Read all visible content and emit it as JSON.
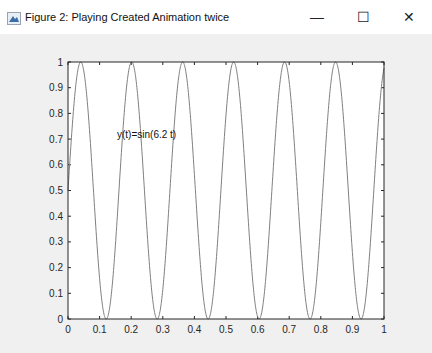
{
  "window": {
    "title": "Figure 2: Playing Created Animation twice",
    "icon": "matlab-figure-icon",
    "controls": {
      "minimize": "—",
      "maximize": "☐",
      "close": "✕"
    }
  },
  "annotation": "y(t)=sin(6.2 t)",
  "chart_data": {
    "type": "line",
    "title": "",
    "xlabel": "",
    "ylabel": "",
    "xlim": [
      0,
      1
    ],
    "ylim": [
      0,
      1
    ],
    "xticks": [
      "0",
      "0.1",
      "0.2",
      "0.3",
      "0.4",
      "0.5",
      "0.6",
      "0.7",
      "0.8",
      "0.9",
      "1"
    ],
    "yticks": [
      "0",
      "0.1",
      "0.2",
      "0.3",
      "0.4",
      "0.5",
      "0.6",
      "0.7",
      "0.8",
      "0.9",
      "1"
    ],
    "annotation": "y(t)=sin(6.2 t)",
    "series": [
      {
        "name": "y(t)",
        "formula": "0.5+0.5*sin(2*pi*6.2*t)",
        "color": "#808080"
      }
    ],
    "grid": false,
    "legend": null
  }
}
